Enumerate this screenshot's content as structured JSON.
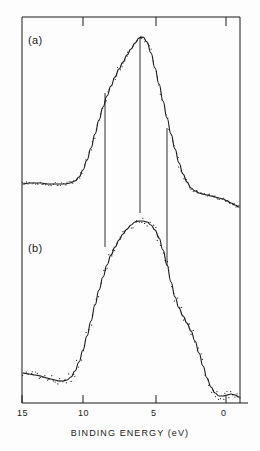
{
  "figure": {
    "background_color": "#fdfdfd",
    "ink_color": "#1a1a1a",
    "frame": {
      "left": 22,
      "right": 240,
      "top": 17,
      "bottom": 403
    }
  },
  "axis": {
    "x_title": "BINDING ENERGY (eV)",
    "x_ticks": [
      {
        "label": "15",
        "value": 15,
        "px": 22
      },
      {
        "label": "10",
        "value": 10,
        "px": 83
      },
      {
        "label": "5",
        "value": 5,
        "px": 156
      },
      {
        "label": "0",
        "value": 0,
        "px": 226
      }
    ],
    "x_direction": "decreasing-left-to-right",
    "x_range_ev": [
      16.5,
      -1.1
    ]
  },
  "panels": [
    {
      "id": "a",
      "label": "(a)",
      "label_x": 28,
      "label_y": 34
    },
    {
      "id": "b",
      "label": "(b)",
      "label_x": 28,
      "label_y": 242
    }
  ],
  "markers": {
    "description": "vertical guide lines linking features of spectrum (a) and (b)",
    "lines": [
      {
        "x": 105,
        "y_top": 93,
        "y_bottom": 247,
        "binding_energy_ev": 8.5
      },
      {
        "x": 140,
        "y_top": 37,
        "y_bottom": 213,
        "binding_energy_ev": 6.1
      },
      {
        "x": 167,
        "y_top": 128,
        "y_bottom": 266,
        "binding_energy_ev": 4.2
      }
    ]
  },
  "chart_data": {
    "type": "line",
    "title": "",
    "xlabel": "BINDING ENERGY (eV)",
    "ylabel": "",
    "xlim": [
      16.5,
      -1.1
    ],
    "grid": false,
    "legend": null,
    "axis_reversed": true,
    "annotations": [
      "(a)",
      "(b)"
    ],
    "series": [
      {
        "name": "(a)",
        "panel": "a",
        "style": "solid-curve-with-data-points",
        "curve_px": [
          [
            23,
            184
          ],
          [
            29,
            183
          ],
          [
            35,
            183
          ],
          [
            41,
            183
          ],
          [
            47,
            184
          ],
          [
            53,
            184
          ],
          [
            59,
            184
          ],
          [
            65,
            184
          ],
          [
            70,
            183
          ],
          [
            75,
            181
          ],
          [
            79,
            177
          ],
          [
            83,
            170
          ],
          [
            87,
            160
          ],
          [
            91,
            148
          ],
          [
            95,
            134
          ],
          [
            99,
            120
          ],
          [
            103,
            107
          ],
          [
            107,
            96
          ],
          [
            111,
            86
          ],
          [
            115,
            77
          ],
          [
            119,
            69
          ],
          [
            123,
            62
          ],
          [
            127,
            55
          ],
          [
            131,
            49
          ],
          [
            135,
            43
          ],
          [
            139,
            38
          ],
          [
            143,
            37
          ],
          [
            147,
            42
          ],
          [
            151,
            53
          ],
          [
            155,
            68
          ],
          [
            159,
            84
          ],
          [
            163,
            101
          ],
          [
            167,
            118
          ],
          [
            171,
            134
          ],
          [
            175,
            149
          ],
          [
            179,
            163
          ],
          [
            183,
            174
          ],
          [
            187,
            182
          ],
          [
            191,
            188
          ],
          [
            195,
            191
          ],
          [
            199,
            193
          ],
          [
            203,
            194
          ],
          [
            207,
            195
          ],
          [
            211,
            196
          ],
          [
            215,
            197
          ],
          [
            219,
            198
          ],
          [
            223,
            199
          ],
          [
            227,
            201
          ],
          [
            231,
            203
          ],
          [
            235,
            205
          ],
          [
            239,
            207
          ]
        ]
      },
      {
        "name": "(b)",
        "panel": "b",
        "style": "solid-curve-with-scattered-data-points",
        "curve_px": [
          [
            23,
            373
          ],
          [
            29,
            374
          ],
          [
            35,
            375
          ],
          [
            41,
            376
          ],
          [
            43,
            377
          ],
          [
            47,
            378
          ],
          [
            51,
            379
          ],
          [
            55,
            380
          ],
          [
            59,
            381
          ],
          [
            63,
            381
          ],
          [
            67,
            380
          ],
          [
            71,
            377
          ],
          [
            75,
            371
          ],
          [
            79,
            362
          ],
          [
            83,
            350
          ],
          [
            87,
            336
          ],
          [
            91,
            321
          ],
          [
            95,
            305
          ],
          [
            99,
            290
          ],
          [
            103,
            277
          ],
          [
            107,
            265
          ],
          [
            111,
            255
          ],
          [
            115,
            247
          ],
          [
            119,
            240
          ],
          [
            123,
            234
          ],
          [
            127,
            229
          ],
          [
            131,
            225
          ],
          [
            135,
            222
          ],
          [
            139,
            221
          ],
          [
            143,
            221
          ],
          [
            147,
            222
          ],
          [
            151,
            225
          ],
          [
            155,
            230
          ],
          [
            159,
            238
          ],
          [
            163,
            250
          ],
          [
            167,
            265
          ],
          [
            171,
            282
          ],
          [
            175,
            297
          ],
          [
            179,
            308
          ],
          [
            183,
            316
          ],
          [
            187,
            323
          ],
          [
            191,
            331
          ],
          [
            195,
            341
          ],
          [
            199,
            353
          ],
          [
            203,
            366
          ],
          [
            207,
            378
          ],
          [
            211,
            387
          ],
          [
            215,
            393
          ],
          [
            219,
            396
          ],
          [
            223,
            396
          ],
          [
            227,
            395
          ],
          [
            231,
            394
          ],
          [
            235,
            395
          ],
          [
            239,
            397
          ]
        ]
      }
    ]
  }
}
